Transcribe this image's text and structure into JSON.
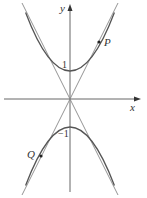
{
  "diagram": {
    "axes": {
      "x_label": "x",
      "y_label": "y"
    },
    "ticks": {
      "y_pos": "1",
      "y_neg": "−1"
    },
    "points": {
      "P": "P",
      "Q": "Q"
    },
    "curves": [
      {
        "name": "upper-parabola",
        "equation": "y = x^2 + 1",
        "vertex": [
          0,
          1
        ]
      },
      {
        "name": "lower-parabola",
        "equation": "y = -x^2 - 1",
        "vertex": [
          0,
          -1
        ]
      },
      {
        "name": "tangent-line-positive",
        "equation": "y = 2x",
        "through": [
          0,
          0
        ]
      },
      {
        "name": "tangent-line-negative",
        "equation": "y = -2x",
        "through": [
          0,
          0
        ]
      }
    ],
    "colors": {
      "curve": "#555555",
      "axis": "#444444",
      "line": "#888888"
    }
  }
}
